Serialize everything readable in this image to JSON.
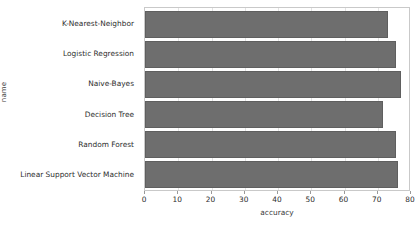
{
  "chart_data": {
    "type": "bar",
    "orientation": "horizontal",
    "title": "",
    "xlabel": "accuracy",
    "ylabel": "name",
    "categories": [
      "K-Nearest-Neighbor",
      "Logistic Regression",
      "Naive-Bayes",
      "Decision Tree",
      "Random Forest",
      "Linear Support Vector Machine"
    ],
    "values": [
      73.0,
      75.5,
      77.0,
      71.5,
      75.5,
      76.0
    ],
    "xlim": [
      0,
      80
    ],
    "xticks": [
      0,
      10,
      20,
      30,
      40,
      50,
      60,
      70,
      80
    ],
    "xtick_labels": [
      "0",
      "10",
      "20",
      "30",
      "40",
      "50",
      "60",
      "70",
      "80"
    ],
    "grid": true,
    "legend": false,
    "bar_color": "#6e6e6e",
    "background_color": "#ffffff",
    "frame_color": "#c9c9c9"
  }
}
